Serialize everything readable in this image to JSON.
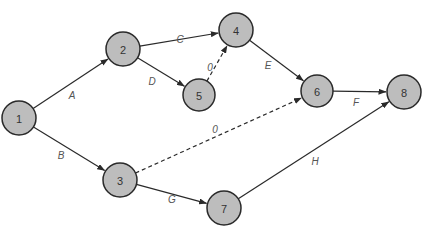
{
  "diagram": {
    "type": "activity-on-arrow network",
    "colors": {
      "node_fill": "#bdbdbd",
      "node_stroke": "#2a2a2a",
      "edge": "#2a2a2a",
      "label": "#555555"
    },
    "nodes": [
      {
        "id": "1",
        "label": "1",
        "x": 19,
        "y": 118,
        "r": 17
      },
      {
        "id": "2",
        "label": "2",
        "x": 123,
        "y": 49,
        "r": 17
      },
      {
        "id": "3",
        "label": "3",
        "x": 120,
        "y": 180,
        "r": 17
      },
      {
        "id": "4",
        "label": "4",
        "x": 236,
        "y": 30,
        "r": 17
      },
      {
        "id": "5",
        "label": "5",
        "x": 199,
        "y": 95,
        "r": 16
      },
      {
        "id": "6",
        "label": "6",
        "x": 317,
        "y": 91,
        "r": 16
      },
      {
        "id": "7",
        "label": "7",
        "x": 224,
        "y": 208,
        "r": 17
      },
      {
        "id": "8",
        "label": "8",
        "x": 404,
        "y": 92,
        "r": 17
      }
    ],
    "edges": [
      {
        "from": "1",
        "to": "2",
        "label": "A",
        "dashed": false,
        "lx": 72,
        "ly": 95
      },
      {
        "from": "1",
        "to": "3",
        "label": "B",
        "dashed": false,
        "lx": 61,
        "ly": 155
      },
      {
        "from": "2",
        "to": "4",
        "label": "C",
        "dashed": false,
        "lx": 180,
        "ly": 39
      },
      {
        "from": "2",
        "to": "5",
        "label": "D",
        "dashed": false,
        "lx": 152,
        "ly": 81
      },
      {
        "from": "5",
        "to": "4",
        "label": "0",
        "dashed": true,
        "lx": 210,
        "ly": 67
      },
      {
        "from": "4",
        "to": "6",
        "label": "E",
        "dashed": false,
        "lx": 268,
        "ly": 65
      },
      {
        "from": "3",
        "to": "6",
        "label": "0",
        "dashed": true,
        "lx": 215,
        "ly": 129
      },
      {
        "from": "6",
        "to": "8",
        "label": "F",
        "dashed": false,
        "lx": 356,
        "ly": 102
      },
      {
        "from": "3",
        "to": "7",
        "label": "G",
        "dashed": false,
        "lx": 172,
        "ly": 199
      },
      {
        "from": "7",
        "to": "8",
        "label": "H",
        "dashed": false,
        "lx": 315,
        "ly": 161
      }
    ]
  }
}
